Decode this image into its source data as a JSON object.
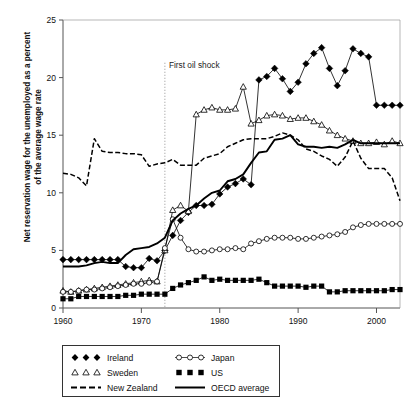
{
  "chart_data": {
    "type": "line",
    "title": "",
    "xlabel": "",
    "ylabel": "Net reservation wage for the unemployed as a percent of the average wage rate",
    "xlim": [
      1960,
      2003
    ],
    "ylim": [
      0,
      25
    ],
    "yticks": [
      0,
      5,
      10,
      15,
      20,
      25
    ],
    "xticks": [
      1960,
      1970,
      1980,
      1990,
      2000
    ],
    "grid": false,
    "legend_position": "below-plot",
    "annotations": [
      {
        "text": "First oil shock",
        "x": 1973,
        "y": 21.2,
        "style": "dotted-vertical-line"
      }
    ],
    "x": [
      1960,
      1961,
      1962,
      1963,
      1964,
      1965,
      1966,
      1967,
      1968,
      1969,
      1970,
      1971,
      1972,
      1973,
      1974,
      1975,
      1976,
      1977,
      1978,
      1979,
      1980,
      1981,
      1982,
      1983,
      1984,
      1985,
      1986,
      1987,
      1988,
      1989,
      1990,
      1991,
      1992,
      1993,
      1994,
      1995,
      1996,
      1997,
      1998,
      1999,
      2000,
      2001,
      2002,
      2003
    ],
    "series": [
      {
        "name": "Ireland",
        "marker": "filled-diamond",
        "line": "solid",
        "color": "#000000",
        "values": [
          4.2,
          4.2,
          4.2,
          4.2,
          4.2,
          4.2,
          4.2,
          4.2,
          3.6,
          3.5,
          3.5,
          4.3,
          4.1,
          5.0,
          6.3,
          7.6,
          8.3,
          8.9,
          8.9,
          9.0,
          9.9,
          10.5,
          10.8,
          11.2,
          10.7,
          19.8,
          20.1,
          20.8,
          19.9,
          18.8,
          19.6,
          21.2,
          22.1,
          22.6,
          20.8,
          19.3,
          20.6,
          22.5,
          22.1,
          21.8,
          17.6,
          17.6,
          17.6,
          17.6
        ]
      },
      {
        "name": "Sweden",
        "marker": "open-triangle",
        "line": "solid",
        "color": "#000000",
        "values": [
          1.5,
          1.4,
          1.5,
          1.6,
          1.7,
          1.8,
          1.9,
          2.0,
          2.1,
          2.2,
          2.3,
          2.4,
          2.3,
          5.0,
          8.5,
          8.9,
          8.4,
          16.8,
          17.2,
          17.4,
          17.2,
          17.2,
          17.3,
          19.2,
          16.0,
          16.3,
          16.7,
          16.8,
          16.7,
          16.4,
          16.5,
          16.5,
          16.2,
          15.9,
          15.4,
          15.0,
          14.7,
          14.5,
          14.3,
          14.3,
          14.4,
          14.2,
          14.5,
          14.3
        ]
      },
      {
        "name": "New Zealand",
        "marker": "dash-tick",
        "line": "dashed",
        "color": "#000000",
        "values": [
          11.7,
          11.6,
          11.3,
          10.6,
          14.7,
          13.6,
          13.5,
          13.5,
          13.4,
          13.4,
          13.3,
          12.3,
          12.5,
          12.6,
          12.9,
          12.4,
          12.4,
          12.4,
          13.0,
          13.2,
          13.4,
          14.0,
          14.3,
          14.6,
          14.7,
          14.7,
          14.7,
          14.9,
          15.2,
          15.0,
          14.6,
          13.8,
          13.6,
          13.2,
          12.9,
          12.3,
          13.1,
          14.5,
          13.0,
          12.1,
          12.1,
          12.1,
          11.3,
          9.3
        ]
      },
      {
        "name": "Japan",
        "marker": "open-circle",
        "line": "solid",
        "color": "#000000",
        "values": [
          1.4,
          1.4,
          1.5,
          1.6,
          1.6,
          1.7,
          1.8,
          1.9,
          2.0,
          2.1,
          2.1,
          2.2,
          2.3,
          5.2,
          7.7,
          6.1,
          5.1,
          4.9,
          4.9,
          5.0,
          5.1,
          5.1,
          5.2,
          5.1,
          5.6,
          5.8,
          6.0,
          6.1,
          6.1,
          6.1,
          6.0,
          6.0,
          6.1,
          6.2,
          6.3,
          6.4,
          6.6,
          7.0,
          7.2,
          7.3,
          7.3,
          7.3,
          7.3,
          7.3
        ]
      },
      {
        "name": "US",
        "marker": "filled-square",
        "line": "solid",
        "color": "#000000",
        "values": [
          0.8,
          0.8,
          1.0,
          1.0,
          1.0,
          1.0,
          1.0,
          1.0,
          1.1,
          1.1,
          1.2,
          1.2,
          1.2,
          1.2,
          1.7,
          2.0,
          2.2,
          2.4,
          2.7,
          2.4,
          2.5,
          2.4,
          2.4,
          2.4,
          2.4,
          2.5,
          2.2,
          1.9,
          1.9,
          1.9,
          1.9,
          1.8,
          1.9,
          1.9,
          1.4,
          1.4,
          1.5,
          1.5,
          1.5,
          1.5,
          1.5,
          1.5,
          1.6,
          1.6
        ]
      },
      {
        "name": "OECD average",
        "marker": "none",
        "line": "solid-thick",
        "color": "#000000",
        "values": [
          3.6,
          3.6,
          3.6,
          3.7,
          3.9,
          4.0,
          3.9,
          3.9,
          4.6,
          5.1,
          5.2,
          5.3,
          5.6,
          6.1,
          7.6,
          8.2,
          8.6,
          8.9,
          9.5,
          10.0,
          10.2,
          11.0,
          11.2,
          11.6,
          12.6,
          13.5,
          13.6,
          14.6,
          14.7,
          15.0,
          14.2,
          14.0,
          14.0,
          13.9,
          14.0,
          13.9,
          14.2,
          14.6,
          14.3,
          14.3,
          14.3,
          14.3,
          14.3,
          14.3
        ]
      }
    ]
  },
  "axis": {
    "yticks_labels": [
      "0",
      "5",
      "10",
      "15",
      "20",
      "25"
    ],
    "xticks_labels": [
      "1960",
      "1970",
      "1980",
      "1990",
      "2000"
    ],
    "ylabel_line1": "Net reservation wage for the unemployed as a percent",
    "ylabel_line2": "of the average wage rate"
  },
  "annotation": {
    "first_oil_shock": "First oil shock"
  },
  "legend": {
    "items": [
      {
        "label": "Ireland",
        "symbol": "filled-diamond"
      },
      {
        "label": "Japan",
        "symbol": "open-circle"
      },
      {
        "label": "Sweden",
        "symbol": "open-triangle"
      },
      {
        "label": "US",
        "symbol": "filled-square"
      },
      {
        "label": "New Zealand",
        "symbol": "dashed-line"
      },
      {
        "label": "OECD average",
        "symbol": "solid-line"
      }
    ]
  },
  "colors": {
    "ink": "#000000",
    "axis": "#555555",
    "background": "#ffffff"
  }
}
